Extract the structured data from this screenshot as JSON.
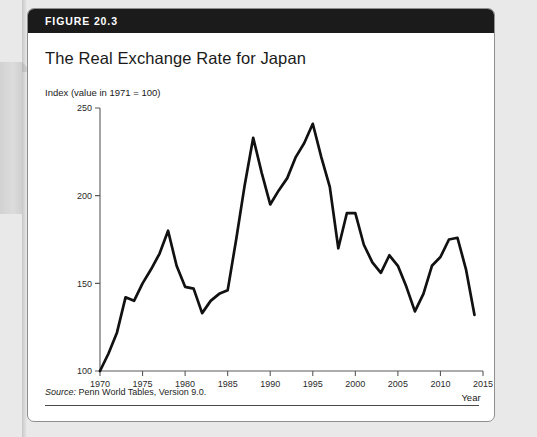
{
  "figure": {
    "number_label": "FIGURE 20.3",
    "title": "The Real Exchange Rate for Japan",
    "source_prefix": "Source:",
    "source_text": " Penn World Tables, Version 9.0."
  },
  "chart_data": {
    "type": "line",
    "title": "The Real Exchange Rate for Japan",
    "ylabel": "Index (value in 1971 = 100)",
    "xlabel": "Year",
    "xlim": [
      1970,
      2015
    ],
    "ylim": [
      100,
      250
    ],
    "xticks": [
      1970,
      1975,
      1980,
      1985,
      1990,
      1995,
      2000,
      2005,
      2010,
      2015
    ],
    "yticks": [
      100,
      150,
      200,
      250
    ],
    "grid": false,
    "legend": "none",
    "line_color": "#111111",
    "x": [
      1970,
      1971,
      1972,
      1973,
      1974,
      1975,
      1976,
      1977,
      1978,
      1979,
      1980,
      1981,
      1982,
      1983,
      1984,
      1985,
      1986,
      1987,
      1988,
      1989,
      1990,
      1991,
      1992,
      1993,
      1994,
      1995,
      1996,
      1997,
      1998,
      1999,
      2000,
      2001,
      2002,
      2003,
      2004,
      2005,
      2006,
      2007,
      2008,
      2009,
      2010,
      2011,
      2012,
      2013,
      2014
    ],
    "values": [
      100,
      110,
      122,
      142,
      140,
      150,
      158,
      167,
      180,
      160,
      148,
      147,
      133,
      140,
      144,
      146,
      175,
      206,
      233,
      213,
      195,
      203,
      210,
      222,
      230,
      241,
      222,
      205,
      170,
      190,
      190,
      172,
      162,
      156,
      166,
      160,
      148,
      134,
      144,
      160,
      165,
      175,
      176,
      158,
      132
    ],
    "series": [
      {
        "name": "Real exchange rate index (Japan)",
        "values": [
          100,
          110,
          122,
          142,
          140,
          150,
          158,
          167,
          180,
          160,
          148,
          147,
          133,
          140,
          144,
          146,
          175,
          206,
          233,
          213,
          195,
          203,
          210,
          222,
          230,
          241,
          222,
          205,
          170,
          190,
          190,
          172,
          162,
          156,
          166,
          160,
          148,
          134,
          144,
          160,
          165,
          175,
          176,
          158,
          132
        ]
      }
    ]
  }
}
